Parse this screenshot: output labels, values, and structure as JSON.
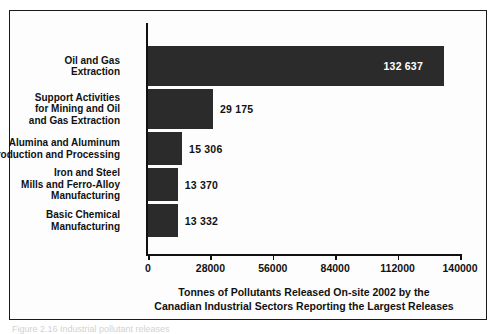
{
  "chart_data": {
    "type": "bar",
    "orientation": "horizontal",
    "title": "",
    "caption_line1": "Tonnes of Pollutants Released On-site 2002 by the",
    "caption_line2": "Canadian Industrial Sectors Reporting the Largest Releases",
    "xlabel": "",
    "ylabel": "",
    "xlim": [
      0,
      140000
    ],
    "grid": false,
    "legend": false,
    "bar_color": "#2b2b2b",
    "categories": [
      "Oil and Gas Extraction",
      "Support Activities for Mining and Oil and Gas Extraction",
      "Alumina and Aluminum Production and Processing",
      "Iron and Steel Mills and Ferro-Alloy Manufacturing",
      "Basic Chemical Manufacturing"
    ],
    "values": [
      132637,
      29175,
      15306,
      13370,
      13332
    ],
    "value_labels": [
      "132 637",
      "29 175",
      "15 306",
      "13 370",
      "13 332"
    ],
    "xticks": [
      0,
      28000,
      56000,
      84000,
      112000,
      140000
    ],
    "xtick_labels": [
      "0",
      "28000",
      "56000",
      "84000",
      "112000",
      "140000"
    ]
  },
  "bars": [
    {
      "label_lines": [
        "Oil and Gas",
        "Extraction"
      ],
      "value": 132637,
      "value_label": "132 637",
      "label_position": "inside"
    },
    {
      "label_lines": [
        "Support Activities",
        "for Mining and Oil",
        "and Gas Extraction"
      ],
      "value": 29175,
      "value_label": "29 175",
      "label_position": "outside"
    },
    {
      "label_lines": [
        "Alumina and Aluminum",
        "Production and Processing"
      ],
      "value": 15306,
      "value_label": "15 306",
      "label_position": "outside"
    },
    {
      "label_lines": [
        "Iron and Steel",
        "Mills and Ferro-Alloy",
        "Manufacturing"
      ],
      "value": 13370,
      "value_label": "13 370",
      "label_position": "outside"
    },
    {
      "label_lines": [
        "Basic Chemical",
        "Manufacturing"
      ],
      "value": 13332,
      "value_label": "13 332",
      "label_position": "outside"
    }
  ],
  "axis": {
    "ticks": [
      "0",
      "28000",
      "56000",
      "84000",
      "112000",
      "140000"
    ]
  },
  "caption": {
    "line1": "Tonnes of Pollutants Released On-site 2002 by the",
    "line2": "Canadian Industrial Sectors Reporting the Largest Releases"
  },
  "below_frame_text": "Figure  2.16  Industrial pollutant releases"
}
